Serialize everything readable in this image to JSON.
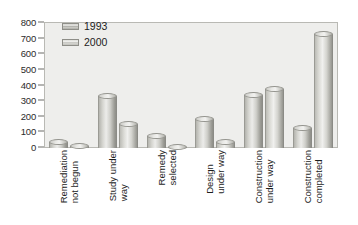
{
  "chart_data": {
    "type": "bar",
    "title": "",
    "xlabel": "",
    "ylabel": "",
    "ylim": [
      0,
      800
    ],
    "yticks": [
      0,
      100,
      200,
      300,
      400,
      500,
      600,
      700,
      800
    ],
    "grid": false,
    "legend_position": "top-left",
    "categories": [
      "Remediation not begun",
      "Study under way",
      "Remedy selected",
      "Design under way",
      "Construction under way",
      "Construction completed"
    ],
    "category_lines": [
      [
        "Remediation",
        "not begun"
      ],
      [
        "Study under",
        "way"
      ],
      [
        "Remedy",
        "selected"
      ],
      [
        "Design",
        "under way"
      ],
      [
        "Construction",
        "under way"
      ],
      [
        "Construction",
        "completed"
      ]
    ],
    "series": [
      {
        "name": "1993",
        "values": [
          60,
          350,
          95,
          205,
          360,
          145
        ]
      },
      {
        "name": "2000",
        "values": [
          35,
          170,
          25,
          55,
          400,
          750
        ]
      }
    ]
  },
  "legend": {
    "items": [
      {
        "label": "1993",
        "swatch": "legend-swatch-1993"
      },
      {
        "label": "2000",
        "swatch": "legend-swatch-2000"
      }
    ]
  },
  "colors": {
    "plot_background": "#eeeeec",
    "page_background": "#ffffff",
    "axis": "#6d6d68",
    "text": "#1d1d1d",
    "bar_light": "#ececea",
    "bar_dark": "#8e8e88"
  }
}
